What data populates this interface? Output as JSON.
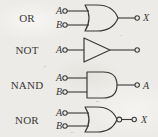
{
  "figure": {
    "kind": "logic-gate-symbol-chart",
    "background_color": "#edebe7",
    "ink_color": "#3a3a38",
    "rows": [
      {
        "name": "or",
        "label": "OR",
        "shape": "or",
        "inverted_output": false,
        "inputs": [
          {
            "label": "A"
          },
          {
            "label": "B"
          }
        ],
        "output": {
          "label": "X"
        }
      },
      {
        "name": "not",
        "label": "NOT",
        "shape": "triangle",
        "inverted_output": false,
        "inputs": [
          {
            "label": "A"
          }
        ],
        "output": {
          "label": ""
        }
      },
      {
        "name": "nand",
        "label": "NAND",
        "shape": "and",
        "inverted_output": false,
        "inputs": [
          {
            "label": "A"
          },
          {
            "label": "B"
          }
        ],
        "output": {
          "label": "A"
        }
      },
      {
        "name": "nor",
        "label": "NOR",
        "shape": "or",
        "inverted_output": true,
        "inputs": [
          {
            "label": "A"
          },
          {
            "label": "B"
          }
        ],
        "output": {
          "label": "X"
        }
      }
    ]
  }
}
